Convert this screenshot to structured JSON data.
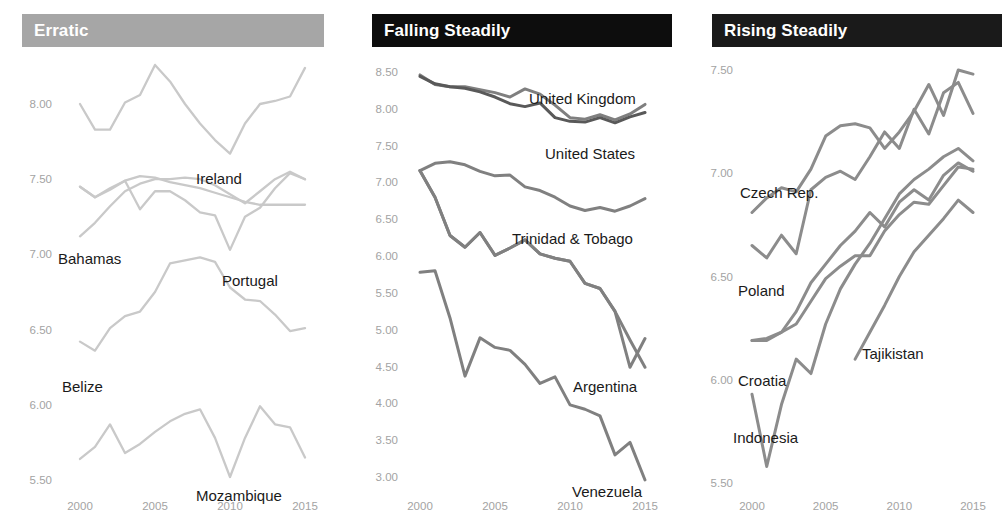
{
  "panels": [
    {
      "id": "erratic",
      "title": "Erratic",
      "header_color": "#a6a6a6",
      "title_color": "#ffffff",
      "yticks": [
        "8.00",
        "7.50",
        "7.00",
        "6.50",
        "6.00",
        "5.50"
      ],
      "xticks": [
        "2000",
        "2005",
        "2010",
        "2015"
      ],
      "labels": [
        {
          "text": "Ireland",
          "x": 196,
          "y": 170
        },
        {
          "text": "Bahamas",
          "x": 58,
          "y": 250
        },
        {
          "text": "Portugal",
          "x": 222,
          "y": 272
        },
        {
          "text": "Belize",
          "x": 62,
          "y": 378
        },
        {
          "text": "Mozambique",
          "x": 196,
          "y": 487
        }
      ]
    },
    {
      "id": "falling",
      "title": "Falling Steadily",
      "header_color": "#0d0d0d",
      "title_color": "#ffffff",
      "yticks": [
        "8.50",
        "8.00",
        "7.50",
        "7.00",
        "6.50",
        "6.00",
        "5.50",
        "5.00",
        "4.50",
        "4.00",
        "3.50",
        "3.00"
      ],
      "xticks": [
        "2000",
        "2005",
        "2010",
        "2015"
      ],
      "labels": [
        {
          "text": "United Kingdom",
          "x": 529,
          "y": 90
        },
        {
          "text": "United States",
          "x": 545,
          "y": 145
        },
        {
          "text": "Trinidad & Tobago",
          "x": 512,
          "y": 230
        },
        {
          "text": "Argentina",
          "x": 573,
          "y": 378
        },
        {
          "text": "Venezuela",
          "x": 572,
          "y": 483
        }
      ]
    },
    {
      "id": "rising",
      "title": "Rising Steadily",
      "header_color": "#1a1a1a",
      "title_color": "#ffffff",
      "yticks": [
        "7.50",
        "7.00",
        "6.50",
        "6.00",
        "5.50"
      ],
      "xticks": [
        "2000",
        "2005",
        "2010",
        "2015"
      ],
      "labels": [
        {
          "text": "Czech Rep.",
          "x": 740,
          "y": 184
        },
        {
          "text": "Poland",
          "x": 738,
          "y": 282
        },
        {
          "text": "Tajikistan",
          "x": 862,
          "y": 345
        },
        {
          "text": "Croatia",
          "x": 738,
          "y": 372
        },
        {
          "text": "Indonesia",
          "x": 733,
          "y": 429
        }
      ]
    }
  ],
  "chart_data": [
    {
      "type": "line",
      "title": "Erratic",
      "xlabel": "",
      "ylabel": "",
      "xlim": [
        2000,
        2015
      ],
      "ylim": [
        5.4,
        8.3
      ],
      "grid": false,
      "legend": "inline-labels",
      "xticks": [
        2000,
        2005,
        2010,
        2015
      ],
      "yticks": [
        8.0,
        7.5,
        7.0,
        6.5,
        6.0,
        5.5
      ],
      "x": [
        2000,
        2001,
        2002,
        2003,
        2004,
        2005,
        2006,
        2007,
        2008,
        2009,
        2010,
        2011,
        2012,
        2013,
        2014,
        2015
      ],
      "series": [
        {
          "name": "Ireland",
          "color": "#c9c9c9",
          "values": [
            8.0,
            7.83,
            7.83,
            8.01,
            8.06,
            8.26,
            8.15,
            8.0,
            7.87,
            7.76,
            7.67,
            7.87,
            8.0,
            8.02,
            8.05,
            8.24
          ]
        },
        {
          "name": "Bahamas",
          "color": "#c9c9c9",
          "values": [
            7.45,
            7.38,
            7.43,
            7.49,
            7.52,
            7.51,
            7.48,
            7.46,
            7.44,
            7.41,
            7.38,
            7.35,
            7.33,
            7.33,
            7.33,
            7.33
          ]
        },
        {
          "name": "Portugal",
          "color": "#c9c9c9",
          "values": [
            7.12,
            7.21,
            7.32,
            7.42,
            7.47,
            7.5,
            7.5,
            7.51,
            7.5,
            7.46,
            7.4,
            7.34,
            7.42,
            7.5,
            7.55,
            7.5
          ]
        },
        {
          "name": "Portugal-b",
          "color": "#c9c9c9",
          "values": [
            7.45,
            7.38,
            7.44,
            7.49,
            7.3,
            7.42,
            7.42,
            7.36,
            7.28,
            7.26,
            7.03,
            7.25,
            7.31,
            7.44,
            7.54,
            7.5
          ]
        },
        {
          "name": "Belize",
          "color": "#c9c9c9",
          "values": [
            6.42,
            6.36,
            6.51,
            6.59,
            6.62,
            6.75,
            6.94,
            6.96,
            6.98,
            6.95,
            6.78,
            6.7,
            6.69,
            6.6,
            6.49,
            6.51
          ]
        },
        {
          "name": "Mozambique",
          "color": "#c9c9c9",
          "values": [
            5.64,
            5.72,
            5.87,
            5.68,
            5.74,
            5.82,
            5.89,
            5.94,
            5.97,
            5.78,
            5.52,
            5.78,
            5.99,
            5.87,
            5.85,
            5.65
          ]
        }
      ]
    },
    {
      "type": "line",
      "title": "Falling Steadily",
      "xlabel": "",
      "ylabel": "",
      "xlim": [
        2000,
        2015
      ],
      "ylim": [
        2.85,
        8.6
      ],
      "grid": false,
      "legend": "inline-labels",
      "xticks": [
        2000,
        2005,
        2010,
        2015
      ],
      "yticks": [
        8.5,
        8.0,
        7.5,
        7.0,
        6.5,
        6.0,
        5.5,
        5.0,
        4.5,
        4.0,
        3.5,
        3.0
      ],
      "x": [
        2000,
        2001,
        2002,
        2003,
        2004,
        2005,
        2006,
        2007,
        2008,
        2009,
        2010,
        2011,
        2012,
        2013,
        2014,
        2015
      ],
      "series": [
        {
          "name": "United Kingdom",
          "color": "#7f7f7f",
          "values": [
            8.46,
            8.33,
            8.3,
            8.3,
            8.26,
            8.22,
            8.16,
            8.27,
            8.2,
            8.05,
            7.88,
            7.86,
            7.92,
            7.85,
            7.93,
            8.06
          ]
        },
        {
          "name": "United States",
          "color": "#595959",
          "values": [
            8.44,
            8.34,
            8.3,
            8.28,
            8.23,
            8.16,
            8.07,
            8.03,
            8.08,
            7.88,
            7.83,
            7.82,
            7.88,
            7.81,
            7.89,
            7.95
          ]
        },
        {
          "name": "Trinidad & Tobago",
          "color": "#808080",
          "values": [
            7.16,
            7.26,
            7.28,
            7.24,
            7.15,
            7.09,
            7.1,
            6.94,
            6.89,
            6.8,
            6.68,
            6.62,
            6.66,
            6.61,
            6.68,
            6.78
          ]
        },
        {
          "name": "Trinidad-b",
          "color": "#808080",
          "values": [
            7.16,
            6.8,
            6.28,
            6.12,
            6.32,
            6.01,
            6.11,
            6.22,
            6.03,
            5.97,
            5.93,
            5.63,
            5.56,
            5.25,
            4.86,
            4.49
          ]
        },
        {
          "name": "Argentina",
          "color": "#808080",
          "values": [
            7.16,
            6.8,
            6.28,
            6.12,
            6.32,
            6.01,
            6.11,
            6.22,
            6.03,
            5.97,
            5.93,
            5.63,
            5.56,
            5.25,
            4.49,
            4.88
          ]
        },
        {
          "name": "Venezuela",
          "color": "#808080",
          "values": [
            5.78,
            5.8,
            5.16,
            4.37,
            4.89,
            4.76,
            4.72,
            4.53,
            4.27,
            4.36,
            3.98,
            3.92,
            3.83,
            3.3,
            3.47,
            2.96
          ]
        }
      ]
    },
    {
      "type": "line",
      "title": "Rising Steadily",
      "xlabel": "",
      "ylabel": "",
      "xlim": [
        2000,
        2015
      ],
      "ylim": [
        5.45,
        7.58
      ],
      "grid": false,
      "legend": "inline-labels",
      "xticks": [
        2000,
        2005,
        2010,
        2015
      ],
      "yticks": [
        7.5,
        7.0,
        6.5,
        6.0,
        5.5
      ],
      "x": [
        2000,
        2001,
        2002,
        2003,
        2004,
        2005,
        2006,
        2007,
        2008,
        2009,
        2010,
        2011,
        2012,
        2013,
        2014,
        2015
      ],
      "series": [
        {
          "name": "Czech Rep.",
          "color": "#8c8c8c",
          "values": [
            6.81,
            6.88,
            6.93,
            6.91,
            7.02,
            7.18,
            7.23,
            7.24,
            7.22,
            7.12,
            7.2,
            7.3,
            7.43,
            7.28,
            7.5,
            7.48
          ]
        },
        {
          "name": "Czech-b",
          "color": "#8c8c8c",
          "values": [
            6.65,
            6.59,
            6.7,
            6.61,
            6.92,
            6.98,
            7.01,
            6.97,
            7.08,
            7.2,
            7.12,
            7.31,
            7.19,
            7.39,
            7.44,
            7.29
          ]
        },
        {
          "name": "Poland",
          "color": "#8c8c8c",
          "values": [
            6.19,
            6.19,
            6.23,
            6.27,
            6.38,
            6.49,
            6.55,
            6.6,
            6.6,
            6.72,
            6.8,
            6.86,
            6.85,
            6.94,
            7.03,
            7.02
          ]
        },
        {
          "name": "Croatia",
          "color": "#8c8c8c",
          "values": [
            6.19,
            6.2,
            6.23,
            6.33,
            6.47,
            6.56,
            6.65,
            6.72,
            6.81,
            6.74,
            6.86,
            6.92,
            6.87,
            6.99,
            7.05,
            7.01
          ]
        },
        {
          "name": "Tajikistan",
          "color": "#8c8c8c",
          "values": [
            null,
            null,
            null,
            null,
            null,
            null,
            null,
            6.1,
            6.23,
            6.36,
            6.5,
            6.62,
            6.7,
            6.78,
            6.87,
            6.81
          ]
        },
        {
          "name": "Indonesia",
          "color": "#8c8c8c",
          "values": [
            5.93,
            5.58,
            5.88,
            6.1,
            6.03,
            6.27,
            6.44,
            6.56,
            6.66,
            6.78,
            6.9,
            6.97,
            7.02,
            7.08,
            7.12,
            7.06
          ]
        }
      ]
    }
  ]
}
